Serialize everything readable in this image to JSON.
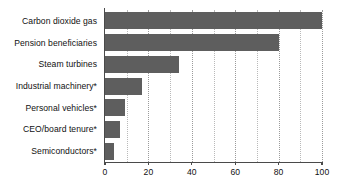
{
  "chart_data": {
    "type": "bar",
    "orientation": "horizontal",
    "title": "",
    "subtitle": "",
    "xlabel": "",
    "ylabel": "",
    "xlim": [
      0,
      100
    ],
    "grid": true,
    "legend": null,
    "bar_color": "#5e5e5e",
    "axis_color": "#4a4a4a",
    "gridline_color": "#b9b9b9",
    "text_color": "#111111",
    "background": "#ffffff",
    "x_major_ticks": [
      0,
      20,
      40,
      60,
      80,
      100
    ],
    "x_minor_gridlines": [
      10,
      30,
      50,
      70,
      90
    ],
    "x_tick_labels": [
      "0",
      "20",
      "40",
      "60",
      "80",
      "100"
    ],
    "categories": [
      "Carbon dioxide gas",
      "Pension beneficiaries",
      "Steam turbines",
      "Industrial machinery*",
      "Personal vehicles*",
      "CEO/board tenure*",
      "Semiconductors*"
    ],
    "values": [
      100,
      80,
      34,
      17,
      9,
      7,
      4
    ]
  }
}
